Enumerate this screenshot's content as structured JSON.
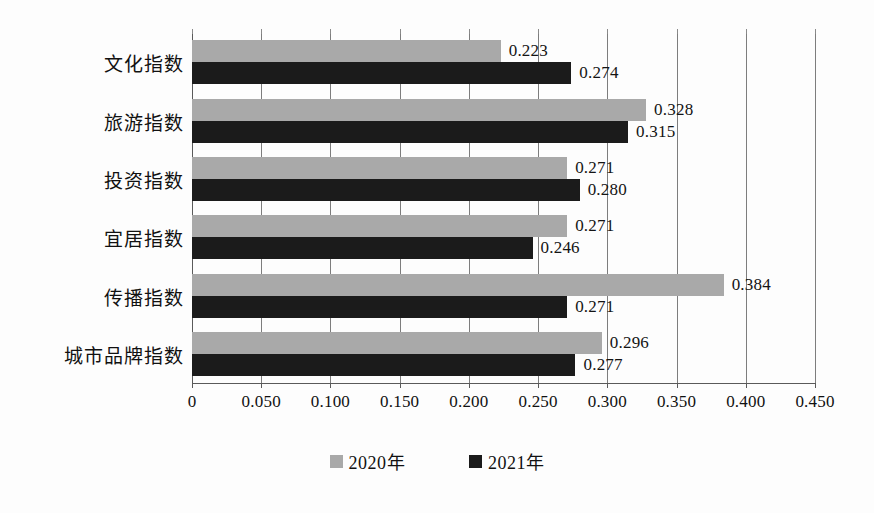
{
  "chart_data": {
    "type": "bar",
    "orientation": "horizontal",
    "title": "",
    "subtitle": "",
    "xlabel": "",
    "ylabel": "",
    "xlim": [
      0,
      0.45
    ],
    "grid": true,
    "legend_position": "bottom",
    "categories": [
      "文化指数",
      "旅游指数",
      "投资指数",
      "宜居指数",
      "传播指数",
      "城市品牌指数"
    ],
    "series": [
      {
        "name": "2020年",
        "color": "#a9a9a9",
        "values": [
          0.223,
          0.328,
          0.271,
          0.271,
          0.384,
          0.296
        ],
        "labels": [
          "0.223",
          "0.328",
          "0.271",
          "0.271",
          "0.384",
          "0.296"
        ]
      },
      {
        "name": "2021年",
        "color": "#1b1b1b",
        "values": [
          0.274,
          0.315,
          0.28,
          0.246,
          0.271,
          0.277
        ],
        "labels": [
          "0.274",
          "0.315",
          "0.280",
          "0.246",
          "0.271",
          "0.277"
        ]
      }
    ],
    "xticks": [
      0,
      0.05,
      0.1,
      0.15,
      0.2,
      0.25,
      0.3,
      0.35,
      0.4,
      0.45
    ],
    "xtick_labels": [
      "0",
      "0.050",
      "0.100",
      "0.150",
      "0.200",
      "0.250",
      "0.300",
      "0.350",
      "0.400",
      "0.450"
    ]
  },
  "legend": {
    "items": [
      {
        "label": "2020年",
        "color": "#a9a9a9"
      },
      {
        "label": "2021年",
        "color": "#1b1b1b"
      }
    ]
  },
  "colors": {
    "series_2020": "#a9a9a9",
    "series_2021": "#1b1b1b",
    "grid": "#7d7d7d",
    "axis": "#5a5a5a",
    "text": "#111111",
    "background": "#fdfdfd"
  }
}
